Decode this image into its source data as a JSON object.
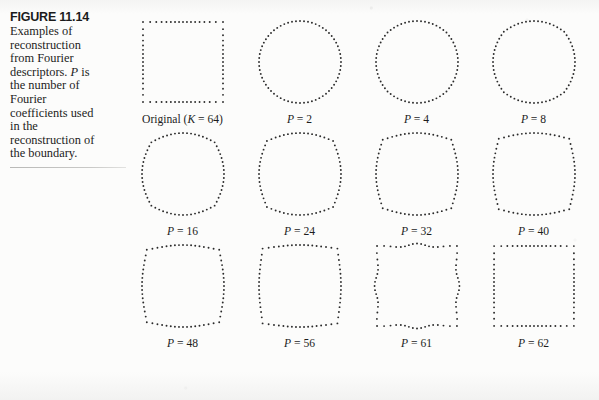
{
  "figure": {
    "number_label": "FIGURE 11.14",
    "caption": "Examples of\nreconstruction\nfrom Fourier\ndescriptors. P is\nthe number of\nFourier\ncoefficients used\nin the\nreconstruction of\nthe boundary.",
    "caption_italic_symbol": "P",
    "background_color": "#fbfbfa",
    "ink_color": "#1c1c1c",
    "dot_color": "#2a2a2a"
  },
  "chart_data": {
    "type": "scatter",
    "title": "FIGURE 11.14",
    "subtitle": "Examples of reconstruction from Fourier descriptors. P is the number of Fourier coefficients used in the reconstruction of the boundary.",
    "xlabel": "",
    "ylabel": "",
    "grid": false,
    "legend": "none",
    "panel_layout": {
      "rows": 3,
      "cols": 4
    },
    "marker": "dot",
    "panels": [
      {
        "label": "Original (K = 64)",
        "P": null,
        "K": 64,
        "shape": "square",
        "points": 64,
        "squareness": 1.0
      },
      {
        "label": "P = 2",
        "P": 2,
        "K": 64,
        "shape": "circle",
        "points": 64,
        "squareness": 0.0
      },
      {
        "label": "P = 4",
        "P": 4,
        "K": 64,
        "shape": "circle",
        "points": 64,
        "squareness": 0.04
      },
      {
        "label": "P = 8",
        "P": 8,
        "K": 64,
        "shape": "near-circle",
        "points": 64,
        "squareness": 0.1
      },
      {
        "label": "P = 16",
        "P": 16,
        "K": 64,
        "shape": "rounded-square",
        "points": 64,
        "squareness": 0.22
      },
      {
        "label": "P = 24",
        "P": 24,
        "K": 64,
        "shape": "rounded-square",
        "points": 64,
        "squareness": 0.34
      },
      {
        "label": "P = 32",
        "P": 32,
        "K": 64,
        "shape": "rounded-square",
        "points": 64,
        "squareness": 0.44
      },
      {
        "label": "P = 40",
        "P": 40,
        "K": 64,
        "shape": "rounded-square",
        "points": 64,
        "squareness": 0.52
      },
      {
        "label": "P = 48",
        "P": 48,
        "K": 64,
        "shape": "rounded-square",
        "points": 64,
        "squareness": 0.6
      },
      {
        "label": "P = 56",
        "P": 56,
        "K": 64,
        "shape": "rounded-square",
        "points": 64,
        "squareness": 0.7
      },
      {
        "label": "P = 61",
        "P": 61,
        "K": 64,
        "shape": "wavy-square",
        "points": 64,
        "squareness": 0.8
      },
      {
        "label": "P = 62",
        "P": 62,
        "K": 64,
        "shape": "square",
        "points": 64,
        "squareness": 0.99
      }
    ]
  }
}
